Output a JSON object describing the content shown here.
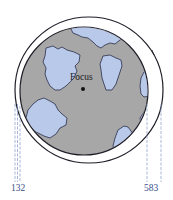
{
  "diagram": {
    "focus_label": "Focus",
    "left_label": "132",
    "right_label": "583",
    "colors": {
      "planet": "#a7a7a7",
      "continents": "#b9c9ea",
      "outline": "#1e1e28",
      "dashed": "#8fa3cf",
      "label": "#3b4f8a",
      "background": "#ffffff"
    }
  }
}
